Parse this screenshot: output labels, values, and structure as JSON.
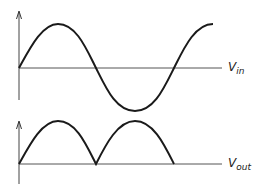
{
  "diagram": {
    "top_plot": {
      "label_main": "V",
      "label_sub": "in",
      "waveform": "sine",
      "axis_y": 68
    },
    "bottom_plot": {
      "label_main": "V",
      "label_sub": "out",
      "waveform": "rectified-sine",
      "axis_y": 164
    },
    "colors": {
      "stroke": "#1a1a1a",
      "axis": "#555555",
      "background": "#ffffff"
    }
  }
}
